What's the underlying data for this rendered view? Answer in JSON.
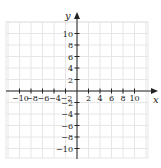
{
  "figure": {
    "type": "coordinate-plane",
    "x_axis": {
      "label": "x",
      "min": -10,
      "max": 10,
      "tick_step": 2,
      "tick_labels": [
        "−10",
        "−8",
        "−6",
        "−4",
        "−2",
        "2",
        "4",
        "6",
        "8",
        "10"
      ]
    },
    "y_axis": {
      "label": "y",
      "min": -10,
      "max": 10,
      "tick_step": 2,
      "tick_labels": [
        "10",
        "8",
        "6",
        "4",
        "2",
        "−2",
        "−4",
        "−6",
        "−8",
        "−10"
      ]
    },
    "grid": {
      "visible": true,
      "step": 2,
      "color": "#e6e6e6"
    },
    "colors": {
      "axis": "#222222",
      "background": "#ffffff"
    }
  }
}
